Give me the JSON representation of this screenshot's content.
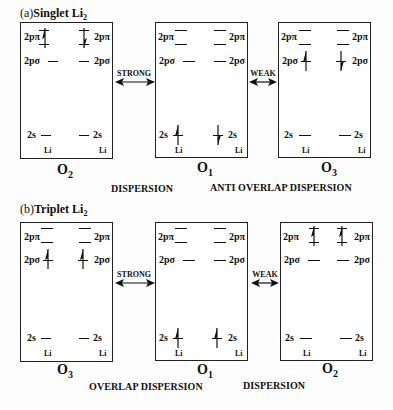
{
  "panels": [
    {
      "id": "a",
      "title_prefix": "(a)",
      "title_bold": "Singlet Li",
      "title_sub": "2",
      "orbitals": [
        {
          "name": "O",
          "sub": "2",
          "spin_2ppi": "up-left/down-right",
          "spin_2psigma": "none",
          "spin_2s": "none"
        },
        {
          "name": "O",
          "sub": "1",
          "spin_2ppi": "none",
          "spin_2psigma": "none",
          "spin_2s": "up-left/down-right"
        },
        {
          "name": "O",
          "sub": "3",
          "spin_2ppi": "none",
          "spin_2psigma": "up-left/down-right",
          "spin_2s": "none"
        }
      ],
      "arrows": [
        "STRONG",
        "WEAK"
      ],
      "captions": [
        "DISPERSION",
        "ANTI OVERLAP DISPERSION"
      ]
    },
    {
      "id": "b",
      "title_prefix": "(b)",
      "title_bold": "Triplet Li",
      "title_sub": "2",
      "orbitals": [
        {
          "name": "O",
          "sub": "3",
          "spin_2ppi": "none",
          "spin_2psigma": "up/up",
          "spin_2s": "none"
        },
        {
          "name": "O",
          "sub": "1",
          "spin_2ppi": "none",
          "spin_2psigma": "none",
          "spin_2s": "up/up"
        },
        {
          "name": "O",
          "sub": "2",
          "spin_2ppi": "up/up",
          "spin_2psigma": "none",
          "spin_2s": "none"
        }
      ],
      "arrows": [
        "STRONG",
        "WEAK"
      ],
      "captions": [
        "OVERLAP DISPERSION",
        "DISPERSION"
      ]
    }
  ],
  "labels": {
    "ppi": "2pπ",
    "psigma": "2pσ",
    "s": "2s",
    "atom": "Li"
  }
}
